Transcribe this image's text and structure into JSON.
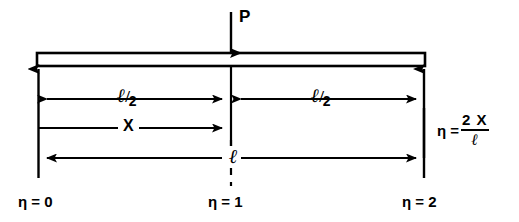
{
  "figure": {
    "type": "beam-loading-diagram",
    "load": {
      "label": "P",
      "direction": "down",
      "position": "midspan"
    },
    "dimensions": {
      "half_span_left": {
        "ell": "ℓ",
        "slash": "/",
        "denominator": "2"
      },
      "half_span_right": {
        "ell": "ℓ",
        "slash": "/",
        "denominator": "2"
      },
      "distance_x": "X",
      "full_span": "ℓ"
    },
    "formula": {
      "lhs": "η =",
      "numerator": "2 X",
      "denominator": "ℓ"
    },
    "stations": [
      {
        "label": "η = 0",
        "position": "left-support"
      },
      {
        "label": "η = 1",
        "position": "midspan"
      },
      {
        "label": "η = 2",
        "position": "right-support"
      }
    ],
    "colors": {
      "ink": "#000000",
      "background": "#ffffff"
    }
  }
}
